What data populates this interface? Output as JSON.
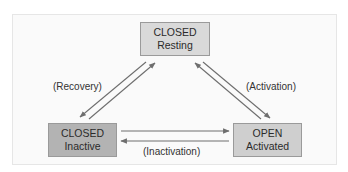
{
  "diagram": {
    "type": "state-transition",
    "states": [
      {
        "id": "resting",
        "line1": "CLOSED",
        "line2": "Resting",
        "fill": "#d9d9d9"
      },
      {
        "id": "inactive",
        "line1": "CLOSED",
        "line2": "Inactive",
        "fill": "#b3b3b3"
      },
      {
        "id": "activated",
        "line1": "OPEN",
        "line2": "Activated",
        "fill": "#cfcfcf"
      }
    ],
    "transitions": [
      {
        "from": "resting",
        "to": "activated",
        "label": "(Activation)"
      },
      {
        "from": "activated",
        "to": "resting",
        "label": ""
      },
      {
        "from": "inactive",
        "to": "resting",
        "label": "(Recovery)"
      },
      {
        "from": "resting",
        "to": "inactive",
        "label": ""
      },
      {
        "from": "inactive",
        "to": "activated",
        "label": ""
      },
      {
        "from": "activated",
        "to": "inactive",
        "label": "(Inactivation)"
      }
    ],
    "labels": {
      "recovery": "(Recovery)",
      "activation": "(Activation)",
      "inactivation": "(Inactivation)"
    },
    "colors": {
      "arrow": "#6e6e6e",
      "box_border": "#9a9a9a"
    }
  }
}
